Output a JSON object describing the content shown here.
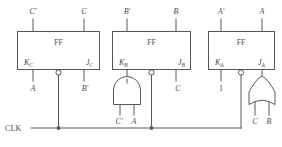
{
  "diagram": {
    "clock": {
      "label": "CLK"
    },
    "flipflops": [
      {
        "id": "ff-c",
        "body_label": "FF",
        "top_left_label": "C'",
        "top_right_label": "C",
        "k_label": "K",
        "k_subscript": "C",
        "j_label": "J",
        "j_subscript": "C",
        "k_input_label": "A",
        "j_input_label": "B'"
      },
      {
        "id": "ff-b",
        "body_label": "FF",
        "top_left_label": "B'",
        "top_right_label": "B",
        "k_label": "K",
        "k_subscript": "B",
        "j_label": "J",
        "j_subscript": "B",
        "k_input_label": "",
        "j_input_label": "C"
      },
      {
        "id": "ff-a",
        "body_label": "FF",
        "top_left_label": "A'",
        "top_right_label": "A",
        "k_label": "K",
        "k_subscript": "A",
        "j_label": "J",
        "j_subscript": "A",
        "k_input_label": "1",
        "j_input_label": ""
      }
    ],
    "gates": [
      {
        "id": "and-gate-b",
        "type": "AND",
        "inputs": [
          "C'",
          "A"
        ],
        "feeds": "K_B"
      },
      {
        "id": "or-gate-a",
        "type": "OR",
        "inputs": [
          "C",
          "B"
        ],
        "feeds": "J_A"
      }
    ],
    "colors": {
      "line": "#58585a",
      "text": "#4a4a4c",
      "background": "#ffffff"
    }
  }
}
